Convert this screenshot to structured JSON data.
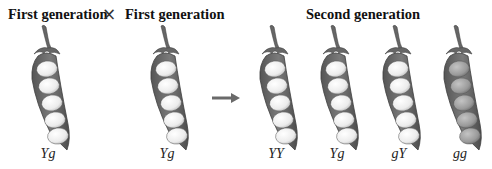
{
  "headers": {
    "first_generation_left": "First generation",
    "cross_symbol": "×",
    "first_generation_right": "First generation",
    "second_generation": "Second generation"
  },
  "pods": [
    {
      "group": "first",
      "genotype": "Yg",
      "pea_color": "yellow",
      "x": 20
    },
    {
      "group": "first",
      "genotype": "Yg",
      "pea_color": "yellow",
      "x": 139
    },
    {
      "group": "second",
      "genotype": "YY",
      "pea_color": "yellow",
      "x": 248
    },
    {
      "group": "second",
      "genotype": "Yg",
      "pea_color": "yellow",
      "x": 309
    },
    {
      "group": "second",
      "genotype": "gY",
      "pea_color": "yellow",
      "x": 371
    },
    {
      "group": "second",
      "genotype": "gg",
      "pea_color": "green",
      "x": 432
    }
  ],
  "arrow": {
    "direction": "right",
    "meaning": "produces"
  },
  "colors": {
    "pod": "#6f6f6f",
    "pod_dark": "#4a4a4a",
    "pea_light": "#f4f4f4",
    "pea_green": "#9a9a9a",
    "arrow": "#6a6a6a"
  }
}
